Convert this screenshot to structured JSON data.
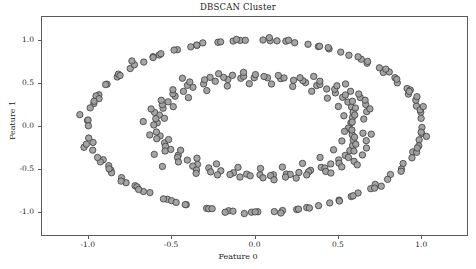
{
  "chart_data": {
    "type": "scatter",
    "title": "DBSCAN Cluster",
    "xlabel": "Feature 0",
    "ylabel": "Feature 1",
    "xlim": [
      -1.28,
      1.28
    ],
    "ylim": [
      -1.28,
      1.28
    ],
    "grid": false,
    "legend": null,
    "xticks": [
      -1.0,
      -0.5,
      0.0,
      0.5,
      1.0
    ],
    "xtick_labels": [
      "-1.0",
      "-0.5",
      "0.0",
      "0.5",
      "1.0"
    ],
    "yticks": [
      -1.0,
      -0.5,
      0.0,
      0.5,
      1.0
    ],
    "ytick_labels": [
      "-1.0",
      "-0.5",
      "0.0",
      "0.5",
      "1.0"
    ],
    "marker": {
      "shape": "circle",
      "size_px": 6.4,
      "fill": "#a0a0a0",
      "edge": "#3c3c3c",
      "edge_width": 0.8,
      "alpha": 0.95
    },
    "series": [
      {
        "name": "cluster 0 (outer ring)",
        "color": "#a0a0a0",
        "points": [
          [
            -1.001,
            0.064
          ],
          [
            -0.963,
            0.262
          ],
          [
            -0.968,
            -0.191
          ],
          [
            -0.933,
            0.363
          ],
          [
            -0.907,
            -0.392
          ],
          [
            -0.884,
            0.487
          ],
          [
            -0.861,
            -0.513
          ],
          [
            -0.823,
            0.571
          ],
          [
            -0.797,
            -0.601
          ],
          [
            -0.745,
            0.669
          ],
          [
            -0.716,
            -0.695
          ],
          [
            -0.664,
            0.744
          ],
          [
            -0.627,
            -0.775
          ],
          [
            -0.571,
            0.826
          ],
          [
            -0.522,
            -0.853
          ],
          [
            -0.462,
            0.888
          ],
          [
            -0.409,
            -0.915
          ],
          [
            -0.345,
            0.939
          ],
          [
            -0.287,
            -0.958
          ],
          [
            -0.219,
            0.974
          ],
          [
            -0.155,
            -0.986
          ],
          [
            -0.086,
            0.996
          ],
          [
            -0.018,
            -1.003
          ],
          [
            0.051,
            1.001
          ],
          [
            0.119,
            -0.996
          ],
          [
            0.188,
            0.987
          ],
          [
            0.253,
            -0.972
          ],
          [
            0.321,
            0.951
          ],
          [
            0.384,
            -0.927
          ],
          [
            0.447,
            0.897
          ],
          [
            0.507,
            -0.862
          ],
          [
            0.566,
            0.823
          ],
          [
            0.621,
            -0.779
          ],
          [
            0.675,
            0.731
          ],
          [
            0.724,
            -0.679
          ],
          [
            0.772,
            0.623
          ],
          [
            0.815,
            -0.564
          ],
          [
            0.856,
            0.502
          ],
          [
            0.891,
            -0.437
          ],
          [
            0.923,
            0.371
          ],
          [
            0.949,
            -0.302
          ],
          [
            0.971,
            0.232
          ],
          [
            0.987,
            -0.161
          ],
          [
            0.999,
            0.089
          ],
          [
            1.004,
            -0.017
          ],
          [
            1.003,
            -0.088
          ],
          [
            0.997,
            0.16
          ],
          [
            0.985,
            -0.231
          ],
          [
            0.967,
            0.301
          ],
          [
            0.944,
            -0.37
          ],
          [
            0.915,
            0.436
          ],
          [
            0.881,
            -0.501
          ],
          [
            0.842,
            0.562
          ],
          [
            0.798,
            -0.621
          ],
          [
            0.749,
            0.677
          ],
          [
            0.697,
            -0.729
          ],
          [
            0.64,
            0.777
          ],
          [
            0.58,
            -0.821
          ],
          [
            0.517,
            0.86
          ],
          [
            0.451,
            -0.895
          ],
          [
            0.383,
            0.925
          ],
          [
            0.313,
            -0.949
          ],
          [
            0.241,
            0.969
          ],
          [
            0.168,
            -0.984
          ],
          [
            0.094,
            0.993
          ],
          [
            0.02,
            -0.998
          ],
          [
            -0.055,
            0.997
          ],
          [
            -0.129,
            -0.991
          ],
          [
            -0.203,
            0.979
          ],
          [
            -0.275,
            -0.963
          ],
          [
            -0.346,
            0.941
          ],
          [
            -0.415,
            -0.915
          ],
          [
            -0.482,
            0.884
          ],
          [
            -0.546,
            -0.848
          ],
          [
            -0.608,
            0.807
          ],
          [
            -0.666,
            -0.762
          ],
          [
            -0.72,
            0.713
          ],
          [
            -0.77,
            -0.66
          ],
          [
            -0.816,
            0.604
          ],
          [
            -0.857,
            -0.544
          ],
          [
            -0.893,
            0.482
          ],
          [
            -0.924,
            -0.417
          ],
          [
            -0.95,
            0.35
          ],
          [
            -0.97,
            -0.281
          ],
          [
            -0.985,
            0.211
          ],
          [
            -0.994,
            -0.14
          ],
          [
            -0.998,
            0.069
          ],
          [
            -0.996,
            0.003
          ],
          [
            -0.932,
            0.318
          ],
          [
            -0.874,
            -0.462
          ],
          [
            -0.806,
            0.588
          ],
          [
            -0.704,
            -0.708
          ],
          [
            -0.608,
            0.796
          ],
          [
            -0.497,
            -0.869
          ],
          [
            -0.382,
            0.921
          ],
          [
            -0.254,
            -0.962
          ],
          [
            -0.128,
            0.988
          ],
          [
            0.004,
            -0.999
          ],
          [
            0.135,
            0.991
          ],
          [
            0.264,
            -0.967
          ],
          [
            0.39,
            0.928
          ],
          [
            0.509,
            -0.873
          ],
          [
            0.621,
            0.805
          ],
          [
            0.72,
            -0.723
          ],
          [
            0.808,
            0.629
          ],
          [
            0.879,
            -0.527
          ],
          [
            0.934,
            0.419
          ],
          [
            0.972,
            -0.306
          ],
          [
            0.993,
            0.189
          ],
          [
            0.999,
            -0.072
          ],
          [
            -1.047,
            0.132
          ],
          [
            -1.022,
            -0.248
          ],
          [
            0.974,
            0.341
          ],
          [
            1.031,
            -0.121
          ],
          [
            -0.735,
            0.757
          ],
          [
            0.76,
            -0.701
          ],
          [
            -0.31,
            0.967
          ],
          [
            0.329,
            -0.955
          ],
          [
            0.853,
            0.544
          ],
          [
            -0.872,
            -0.498
          ],
          [
            -0.561,
            0.841
          ],
          [
            0.591,
            -0.812
          ],
          [
            0.089,
            1.028
          ],
          [
            -0.061,
            -1.019
          ],
          [
            0.678,
            0.752
          ],
          [
            -0.695,
            -0.738
          ],
          [
            0.204,
            0.998
          ],
          [
            -0.176,
            -1.004
          ],
          [
            0.928,
            0.402
          ],
          [
            -0.941,
            -0.366
          ],
          [
            1.012,
            0.226
          ],
          [
            -1.008,
            -0.212
          ],
          [
            0.442,
            0.912
          ],
          [
            -0.47,
            -0.889
          ],
          [
            0.787,
            0.662
          ],
          [
            -0.8,
            -0.641
          ],
          [
            0.976,
            -0.256
          ],
          [
            -0.962,
            0.288
          ],
          [
            0.158,
            -1.012
          ],
          [
            -0.108,
            1.007
          ]
        ]
      },
      {
        "name": "cluster 1 (inner ring)",
        "color": "#a0a0a0",
        "points": [
          [
            -0.583,
            0.038
          ],
          [
            -0.57,
            0.127
          ],
          [
            -0.566,
            -0.115
          ],
          [
            -0.548,
            0.207
          ],
          [
            -0.539,
            -0.196
          ],
          [
            -0.518,
            0.281
          ],
          [
            -0.502,
            -0.272
          ],
          [
            -0.476,
            0.347
          ],
          [
            -0.457,
            -0.339
          ],
          [
            -0.426,
            0.403
          ],
          [
            -0.403,
            -0.397
          ],
          [
            -0.369,
            0.451
          ],
          [
            -0.342,
            -0.447
          ],
          [
            -0.305,
            0.49
          ],
          [
            -0.274,
            -0.488
          ],
          [
            -0.235,
            0.52
          ],
          [
            -0.202,
            -0.521
          ],
          [
            -0.16,
            0.541
          ],
          [
            -0.126,
            -0.544
          ],
          [
            -0.082,
            0.555
          ],
          [
            -0.047,
            -0.56
          ],
          [
            -0.002,
            0.562
          ],
          [
            0.033,
            -0.568
          ],
          [
            0.078,
            0.561
          ],
          [
            0.113,
            -0.568
          ],
          [
            0.157,
            0.551
          ],
          [
            0.191,
            -0.559
          ],
          [
            0.234,
            0.532
          ],
          [
            0.266,
            -0.541
          ],
          [
            0.306,
            0.505
          ],
          [
            0.336,
            -0.515
          ],
          [
            0.373,
            0.471
          ],
          [
            0.4,
            -0.481
          ],
          [
            0.433,
            0.431
          ],
          [
            0.457,
            -0.441
          ],
          [
            0.485,
            0.385
          ],
          [
            0.505,
            -0.394
          ],
          [
            0.528,
            0.334
          ],
          [
            0.544,
            -0.342
          ],
          [
            0.56,
            0.279
          ],
          [
            0.572,
            -0.286
          ],
          [
            0.582,
            0.221
          ],
          [
            0.588,
            -0.227
          ],
          [
            0.591,
            0.161
          ],
          [
            0.592,
            -0.165
          ],
          [
            0.588,
            0.1
          ],
          [
            0.586,
            -0.102
          ],
          [
            0.578,
            0.038
          ],
          [
            0.575,
            -0.039
          ],
          [
            0.563,
            -0.024
          ],
          [
            -0.592,
            0.085
          ],
          [
            -0.588,
            -0.07
          ],
          [
            -0.553,
            0.248
          ],
          [
            -0.534,
            -0.236
          ],
          [
            -0.489,
            0.375
          ],
          [
            -0.462,
            -0.366
          ],
          [
            -0.402,
            0.473
          ],
          [
            -0.37,
            -0.467
          ],
          [
            -0.299,
            0.537
          ],
          [
            -0.263,
            -0.534
          ],
          [
            -0.185,
            0.566
          ],
          [
            -0.147,
            -0.565
          ],
          [
            -0.065,
            0.578
          ],
          [
            -0.026,
            -0.579
          ],
          [
            0.057,
            0.576
          ],
          [
            0.096,
            -0.578
          ],
          [
            0.177,
            0.559
          ],
          [
            0.214,
            -0.563
          ],
          [
            0.29,
            0.528
          ],
          [
            0.324,
            -0.533
          ],
          [
            0.392,
            0.483
          ],
          [
            0.422,
            -0.489
          ],
          [
            0.481,
            0.427
          ],
          [
            0.507,
            -0.433
          ],
          [
            0.545,
            0.361
          ],
          [
            0.563,
            -0.366
          ],
          [
            0.587,
            0.288
          ],
          [
            0.596,
            -0.292
          ],
          [
            0.605,
            0.209
          ],
          [
            0.607,
            -0.212
          ],
          [
            0.601,
            0.128
          ],
          [
            0.6,
            -0.13
          ],
          [
            0.586,
            0.046
          ],
          [
            0.584,
            -0.047
          ],
          [
            -0.604,
            0.012
          ],
          [
            -0.599,
            0.158
          ],
          [
            -0.586,
            -0.148
          ],
          [
            -0.559,
            0.299
          ],
          [
            -0.536,
            -0.291
          ],
          [
            -0.489,
            0.422
          ],
          [
            -0.456,
            -0.418
          ],
          [
            -0.388,
            0.512
          ],
          [
            -0.348,
            -0.512
          ],
          [
            -0.266,
            0.566
          ],
          [
            -0.222,
            -0.569
          ],
          [
            -0.132,
            0.59
          ],
          [
            -0.087,
            -0.594
          ],
          [
            0.006,
            0.598
          ],
          [
            0.051,
            -0.603
          ],
          [
            0.143,
            0.587
          ],
          [
            0.186,
            -0.594
          ],
          [
            0.273,
            0.561
          ],
          [
            0.313,
            -0.569
          ],
          [
            0.392,
            0.521
          ],
          [
            0.427,
            -0.529
          ],
          [
            0.494,
            0.468
          ],
          [
            0.523,
            -0.476
          ],
          [
            0.576,
            0.404
          ],
          [
            0.597,
            -0.411
          ],
          [
            0.634,
            0.331
          ],
          [
            0.647,
            -0.337
          ],
          [
            0.667,
            0.251
          ],
          [
            0.671,
            -0.256
          ],
          [
            0.673,
            0.167
          ],
          [
            0.67,
            -0.171
          ],
          [
            0.655,
            0.081
          ],
          [
            0.65,
            -0.084
          ],
          [
            -0.54,
            0.09
          ],
          [
            -0.515,
            -0.158
          ],
          [
            -0.487,
            0.225
          ],
          [
            -0.443,
            -0.282
          ],
          [
            -0.396,
            0.33
          ],
          [
            -0.345,
            -0.375
          ],
          [
            -0.286,
            0.412
          ],
          [
            -0.228,
            -0.441
          ],
          [
            -0.163,
            0.465
          ],
          [
            -0.099,
            -0.481
          ],
          [
            -0.031,
            0.492
          ],
          [
            0.036,
            -0.494
          ],
          [
            0.102,
            0.489
          ],
          [
            0.167,
            -0.478
          ],
          [
            0.229,
            0.46
          ],
          [
            0.288,
            -0.435
          ],
          [
            0.343,
            0.404
          ],
          [
            0.393,
            -0.366
          ],
          [
            0.437,
            0.324
          ],
          [
            0.474,
            -0.277
          ],
          [
            0.503,
            0.227
          ],
          [
            0.524,
            -0.174
          ],
          [
            0.536,
            0.119
          ],
          [
            0.54,
            -0.063
          ],
          [
            -0.62,
            0.198
          ],
          [
            -0.601,
            -0.33
          ],
          [
            0.625,
            0.372
          ],
          [
            0.616,
            -0.452
          ],
          [
            -0.432,
            0.556
          ],
          [
            0.458,
            -0.547
          ],
          [
            -0.066,
            0.624
          ],
          [
            0.117,
            -0.626
          ],
          [
            0.692,
            0.199
          ],
          [
            -0.628,
            -0.104
          ],
          [
            -0.35,
            -0.551
          ],
          [
            0.355,
            0.577
          ],
          [
            -0.215,
            0.608
          ],
          [
            0.25,
            -0.606
          ],
          [
            0.7,
            -0.095
          ],
          [
            -0.667,
            0.052
          ],
          [
            0.546,
            0.489
          ],
          [
            -0.552,
            -0.471
          ],
          [
            0.663,
            0.3
          ]
        ]
      }
    ]
  },
  "plot_geometry": {
    "frame_left_px": 41,
    "frame_top_px": 16,
    "frame_width_px": 427,
    "frame_height_px": 220
  }
}
